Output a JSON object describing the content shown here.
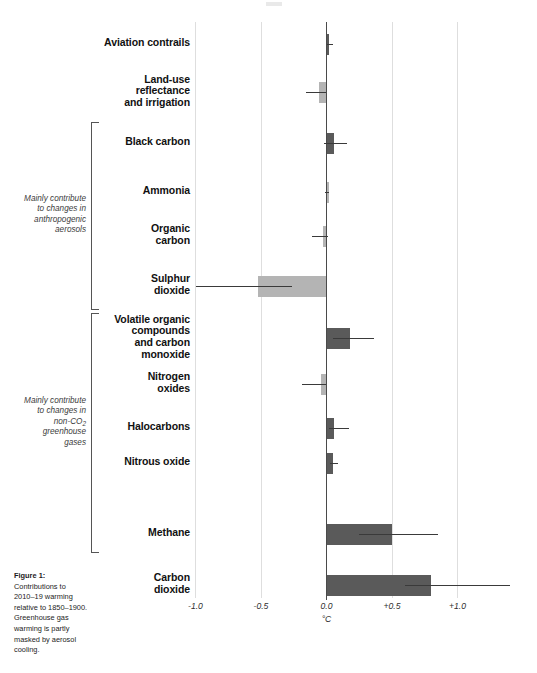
{
  "figure": {
    "caption_title": "Figure 1:",
    "caption_body": "Contributions to 2010–19 warming relative to 1850–1900. Greenhouse gas warming is partly masked by aerosol cooling.",
    "axis_unit": "°C"
  },
  "groups": [
    {
      "id": "aerosols",
      "note_lines": [
        "Mainly contribute",
        "to changes in",
        "anthropogenic",
        "aerosols"
      ],
      "note_text": "Mainly contribute to changes in anthropogenic aerosols"
    },
    {
      "id": "non-co2-ghg",
      "note_lines": [
        "Mainly contribute",
        "to changes in",
        "non-CO₂",
        "greenhouse",
        "gases"
      ],
      "note_text": "Mainly contribute to changes in non-CO2 greenhouse gases"
    }
  ],
  "chart_data": {
    "type": "bar",
    "orientation": "horizontal",
    "title": "",
    "subtitle": "",
    "xlabel": "°C",
    "ylabel": "",
    "xlim": [
      -1.15,
      1.45
    ],
    "xticks": [
      -1.0,
      -0.5,
      0.0,
      0.5,
      1.0
    ],
    "xticklabels": [
      "-1.0",
      "-0.5",
      "0.0",
      "+0.5",
      "+1.0"
    ],
    "grid": true,
    "legend": "none",
    "colors": {
      "warming_bar": "#5a5a5a",
      "cooling_bar": "#b4b4b4",
      "zero_axis": "#4a4a4a",
      "gridline": "#dedede",
      "whisker": "#3a3a3a"
    },
    "categories": [
      "Aviation contrails",
      "Land-use reflectance and irrigation",
      "Black carbon",
      "Ammonia",
      "Organic carbon",
      "Sulphur dioxide",
      "Volatile organic compounds and carbon monoxide",
      "Nitrogen oxides",
      "Halocarbons",
      "Nitrous oxide",
      "Methane",
      "Carbon dioxide"
    ],
    "values": [
      0.02,
      -0.06,
      0.06,
      0.01,
      -0.03,
      -0.52,
      0.18,
      -0.04,
      0.06,
      0.05,
      0.5,
      0.8
    ],
    "error_low": [
      0.0,
      -0.16,
      -0.02,
      -0.01,
      -0.11,
      -1.0,
      0.05,
      -0.19,
      0.02,
      0.03,
      0.25,
      0.6
    ],
    "error_high": [
      0.05,
      0.0,
      0.16,
      0.02,
      0.01,
      -0.26,
      0.36,
      0.0,
      0.17,
      0.09,
      0.85,
      1.4
    ]
  },
  "bars": [
    {
      "label_lines": [
        "Aviation contrails"
      ],
      "label": "Aviation contrails",
      "value": 0.02,
      "low": 0.0,
      "high": 0.05,
      "tone": "warming"
    },
    {
      "label_lines": [
        "Land-use",
        "reflectance",
        "and irrigation"
      ],
      "label": "Land-use reflectance and irrigation",
      "value": -0.06,
      "low": -0.16,
      "high": 0.0,
      "tone": "cooling"
    },
    {
      "label_lines": [
        "Black carbon"
      ],
      "label": "Black carbon",
      "value": 0.06,
      "low": -0.02,
      "high": 0.16,
      "tone": "warming"
    },
    {
      "label_lines": [
        "Ammonia"
      ],
      "label": "Ammonia",
      "value": 0.01,
      "low": -0.01,
      "high": 0.02,
      "tone": "cooling"
    },
    {
      "label_lines": [
        "Organic",
        "carbon"
      ],
      "label": "Organic carbon",
      "value": -0.03,
      "low": -0.11,
      "high": 0.01,
      "tone": "cooling"
    },
    {
      "label_lines": [
        "Sulphur",
        "dioxide"
      ],
      "label": "Sulphur dioxide",
      "value": -0.52,
      "low": -1.0,
      "high": -0.26,
      "tone": "cooling"
    },
    {
      "label_lines": [
        "Volatile organic",
        "compounds",
        "and carbon",
        "monoxide"
      ],
      "label": "Volatile organic compounds and carbon monoxide",
      "value": 0.18,
      "low": 0.05,
      "high": 0.36,
      "tone": "warming"
    },
    {
      "label_lines": [
        "Nitrogen",
        "oxides"
      ],
      "label": "Nitrogen oxides",
      "value": -0.04,
      "low": -0.19,
      "high": 0.0,
      "tone": "cooling"
    },
    {
      "label_lines": [
        "Halocarbons"
      ],
      "label": "Halocarbons",
      "value": 0.06,
      "low": 0.02,
      "high": 0.17,
      "tone": "warming"
    },
    {
      "label_lines": [
        "Nitrous oxide"
      ],
      "label": "Nitrous oxide",
      "value": 0.05,
      "low": 0.03,
      "high": 0.09,
      "tone": "warming"
    },
    {
      "label_lines": [
        "Methane"
      ],
      "label": "Methane",
      "value": 0.5,
      "low": 0.25,
      "high": 0.85,
      "tone": "warming"
    },
    {
      "label_lines": [
        "Carbon",
        "dioxide"
      ],
      "label": "Carbon dioxide",
      "value": 0.8,
      "low": 0.6,
      "high": 1.4,
      "tone": "warming"
    }
  ]
}
